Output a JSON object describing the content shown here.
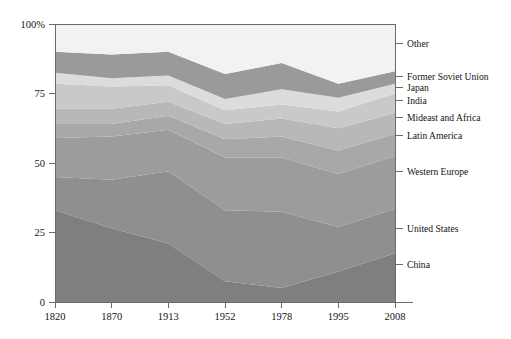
{
  "chart_data": {
    "type": "area",
    "stacked": true,
    "normalized": true,
    "title": "",
    "subtitle": "",
    "xlabel": "",
    "ylabel": "",
    "x": [
      1820,
      1870,
      1913,
      1952,
      1978,
      1995,
      2008
    ],
    "xticks": [
      "1820",
      "1870",
      "1913",
      "1952",
      "1978",
      "1995",
      "2008"
    ],
    "yticks": [
      "0",
      "25",
      "50",
      "75",
      "100%"
    ],
    "ytick_values": [
      0,
      25,
      50,
      75,
      100
    ],
    "ylim": [
      0,
      100
    ],
    "grid": false,
    "legend_position": "right-outside",
    "series": [
      {
        "name": "China",
        "color": "#7f7f7f",
        "values": [
          33.0,
          26.5,
          21.0,
          7.5,
          5.0,
          11.0,
          17.5
        ]
      },
      {
        "name": "United States",
        "color": "#8f8f8f",
        "values": [
          12.0,
          17.5,
          26.0,
          25.5,
          27.5,
          16.0,
          16.0
        ]
      },
      {
        "name": "Western Europe",
        "color": "#9c9c9c",
        "values": [
          14.0,
          15.5,
          15.0,
          19.0,
          19.5,
          19.0,
          19.0
        ]
      },
      {
        "name": "Latin America",
        "color": "#a8a8a8",
        "values": [
          5.0,
          4.5,
          5.0,
          6.5,
          7.5,
          8.5,
          8.0
        ]
      },
      {
        "name": "Mideast and Africa",
        "color": "#b8b8b8",
        "values": [
          5.5,
          5.5,
          5.0,
          5.5,
          6.5,
          8.0,
          7.5
        ]
      },
      {
        "name": "India",
        "color": "#c9c9c9",
        "values": [
          9.0,
          8.0,
          6.0,
          5.0,
          5.0,
          6.0,
          7.0
        ]
      },
      {
        "name": "Japan",
        "color": "#dcdcdc",
        "values": [
          4.0,
          3.0,
          3.5,
          4.0,
          5.5,
          5.0,
          3.5
        ]
      },
      {
        "name": "Former Soviet Union",
        "color": "#9a9a9a",
        "values": [
          7.5,
          8.5,
          8.5,
          9.0,
          9.5,
          5.0,
          4.5
        ]
      },
      {
        "name": "Other",
        "color": "#f2f2f2",
        "values": [
          10.0,
          11.0,
          10.0,
          18.0,
          14.0,
          21.5,
          17.0
        ]
      }
    ],
    "legend_entries": [
      {
        "label": "Other",
        "color": "#f2f2f2"
      },
      {
        "label": "Former Soviet Union",
        "color": "#9a9a9a"
      },
      {
        "label": "Japan",
        "color": "#dcdcdc"
      },
      {
        "label": "India",
        "color": "#c9c9c9"
      },
      {
        "label": "Mideast and Africa",
        "color": "#b8b8b8"
      },
      {
        "label": "Latin America",
        "color": "#a8a8a8"
      },
      {
        "label": "Western Europe",
        "color": "#9c9c9c"
      },
      {
        "label": "United States",
        "color": "#8f8f8f"
      },
      {
        "label": "China",
        "color": "#7f7f7f"
      }
    ],
    "legend_anchor_percent": [
      93.0,
      81.0,
      77.0,
      72.5,
      66.5,
      60.0,
      47.0,
      26.5,
      13.5
    ]
  }
}
